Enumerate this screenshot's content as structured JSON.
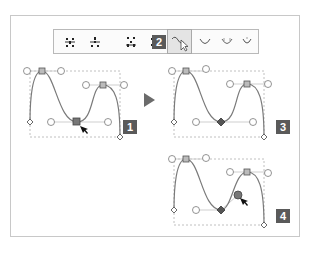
{
  "toolbar": {
    "buttons": [
      {
        "name": "convert-to-corner-points",
        "icon": "corner-points-icon"
      },
      {
        "name": "convert-to-smooth-points",
        "icon": "smooth-points-icon"
      },
      {
        "name": "show-handles-selected",
        "icon": "handles-selected-icon"
      },
      {
        "name": "show-handles-multiple",
        "icon": "handles-multiple-icon"
      },
      {
        "name": "reshape-tool",
        "icon": "reshape-curve-cursor-icon",
        "active": true
      },
      {
        "name": "curve-option-1",
        "icon": "curve-u-icon"
      },
      {
        "name": "curve-option-2",
        "icon": "curve-u-handles-icon"
      },
      {
        "name": "curve-option-3",
        "icon": "curve-u-small-icon"
      }
    ],
    "step_badge": "2"
  },
  "steps": [
    {
      "label": "1",
      "description": "Select smooth anchor point at bottom of curve"
    },
    {
      "label": "3",
      "description": "Anchor converted to corner point"
    },
    {
      "label": "4",
      "description": "Drag handle to reshape curve independently"
    }
  ],
  "colors": {
    "badge_bg": "#5a5a5a",
    "curve": "#7a7a7a",
    "handle_line": "#cfcfcf",
    "bbox": "#b0b0b0",
    "arrow": "#6b6b6b"
  }
}
